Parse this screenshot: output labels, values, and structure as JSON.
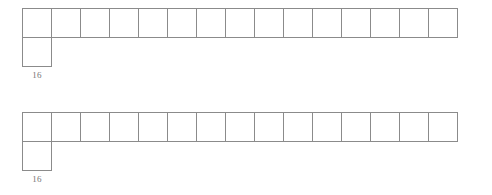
{
  "canvas": {
    "width": 492,
    "height": 195,
    "background": "#ffffff",
    "line_color": "#8b8b8b",
    "label_color": "#777777"
  },
  "diagrams": [
    {
      "id": "diagram-1",
      "strip_cell_count": 15,
      "tail_cell_count": 1,
      "cell_size": 30,
      "label": "16",
      "cells": [
        "",
        "",
        "",
        "",
        "",
        "",
        "",
        "",
        "",
        "",
        "",
        "",
        "",
        "",
        ""
      ],
      "tail_cells": [
        ""
      ]
    },
    {
      "id": "diagram-2",
      "strip_cell_count": 15,
      "tail_cell_count": 1,
      "cell_size": 30,
      "label": "16",
      "cells": [
        "",
        "",
        "",
        "",
        "",
        "",
        "",
        "",
        "",
        "",
        "",
        "",
        "",
        "",
        ""
      ],
      "tail_cells": [
        ""
      ]
    }
  ]
}
